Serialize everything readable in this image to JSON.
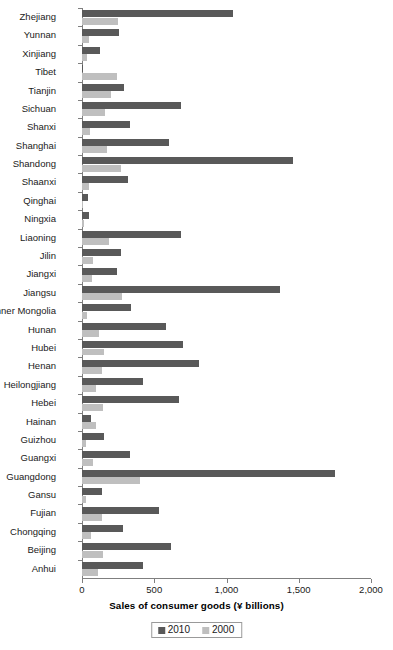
{
  "chart_data": {
    "type": "bar",
    "orientation": "horizontal",
    "title": "",
    "xlabel": "Sales of consumer goods (¥ billions)",
    "ylabel": "",
    "xlim": [
      0,
      2000
    ],
    "xticks": [
      0,
      500,
      1000,
      1500,
      2000
    ],
    "xtick_labels": [
      "0",
      "500",
      "1,000",
      "1,500",
      "2,000"
    ],
    "grid": false,
    "legend_position": "bottom-center",
    "categories": [
      "Zhejiang",
      "Yunnan",
      "Xinjiang",
      "Tibet",
      "Tianjin",
      "Sichuan",
      "Shanxi",
      "Shanghai",
      "Shandong",
      "Shaanxi",
      "Qinghai",
      "Ningxia",
      "Liaoning",
      "Jilin",
      "Jiangxi",
      "Jiangsu",
      "Inner Mongolia",
      "Hunan",
      "Hubei",
      "Henan",
      "Heilongjiang",
      "Hebei",
      "Hainan",
      "Guizhou",
      "Guangxi",
      "Guangdong",
      "Gansu",
      "Fujian",
      "Chongqing",
      "Beijing",
      "Anhui"
    ],
    "series": [
      {
        "name": "2010",
        "color": "#595959",
        "values": [
          1045,
          255,
          125,
          5,
          290,
          685,
          330,
          600,
          1460,
          315,
          40,
          45,
          685,
          270,
          245,
          1370,
          340,
          580,
          700,
          810,
          420,
          670,
          60,
          155,
          330,
          1750,
          140,
          530,
          285,
          615,
          420
        ]
      },
      {
        "name": "2000",
        "color": "#bfbfbf",
        "values": [
          250,
          50,
          35,
          245,
          200,
          160,
          55,
          175,
          270,
          50,
          10,
          12,
          190,
          75,
          70,
          275,
          35,
          120,
          150,
          135,
          100,
          145,
          100,
          30,
          75,
          400,
          30,
          140,
          65,
          145,
          110
        ]
      }
    ]
  },
  "legend": {
    "items": [
      {
        "label": "2010",
        "color": "#595959"
      },
      {
        "label": "2000",
        "color": "#bfbfbf"
      }
    ]
  }
}
